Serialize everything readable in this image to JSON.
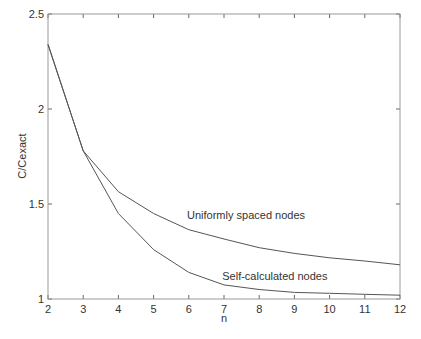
{
  "chart_data": {
    "type": "line",
    "title": "",
    "xlabel": "n",
    "ylabel": "C/Cexact",
    "xlim": [
      2,
      12
    ],
    "ylim": [
      1,
      2.5
    ],
    "x": [
      2,
      3,
      4,
      5,
      6,
      7,
      8,
      9,
      10,
      11,
      12
    ],
    "x_ticks": [
      "2",
      "3",
      "4",
      "5",
      "6",
      "7",
      "8",
      "9",
      "10",
      "11",
      "12"
    ],
    "y_ticks": [
      "1",
      "1.5",
      "2",
      "2.5"
    ],
    "y_tick_values": [
      1,
      1.5,
      2,
      2.5
    ],
    "grid": false,
    "legend": "none (inline annotations)",
    "series": [
      {
        "name": "Uniformly spaced nodes",
        "values": [
          2.34,
          1.78,
          1.565,
          1.45,
          1.365,
          1.316,
          1.27,
          1.24,
          1.217,
          1.2,
          1.18
        ]
      },
      {
        "name": "Self-calculated nodes",
        "values": [
          2.34,
          1.78,
          1.45,
          1.26,
          1.14,
          1.074,
          1.05,
          1.035,
          1.03,
          1.025,
          1.02
        ]
      }
    ],
    "annotations": [
      {
        "text": "Uniformly spaced nodes",
        "x": 5.95,
        "y": 1.42
      },
      {
        "text": "Self-calculated nodes",
        "x": 6.95,
        "y": 1.1
      }
    ]
  },
  "colors": {
    "line": "#555555",
    "frame": "#9a9a9a",
    "text": "#333333"
  }
}
